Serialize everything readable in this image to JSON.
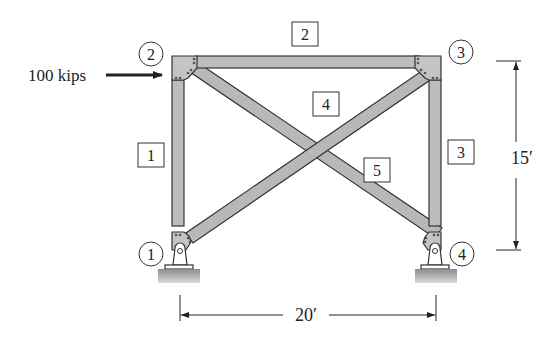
{
  "diagram": {
    "type": "truss-frame",
    "load": {
      "label": "100 kips",
      "direction": "right",
      "applied_at_node": "2"
    },
    "nodes": [
      {
        "id": "1",
        "label": "1",
        "support": "pin"
      },
      {
        "id": "2",
        "label": "2"
      },
      {
        "id": "3",
        "label": "3"
      },
      {
        "id": "4",
        "label": "4",
        "support": "pin"
      }
    ],
    "members": [
      {
        "id": "1",
        "label": "1",
        "from": "1",
        "to": "2"
      },
      {
        "id": "2",
        "label": "2",
        "from": "2",
        "to": "3"
      },
      {
        "id": "3",
        "label": "3",
        "from": "3",
        "to": "4"
      },
      {
        "id": "4",
        "label": "4",
        "from": "1",
        "to": "3"
      },
      {
        "id": "5",
        "label": "5",
        "from": "2",
        "to": "4"
      }
    ],
    "dimensions": {
      "height": "15′",
      "width": "20′"
    },
    "colors": {
      "member_fill": "#b8b8b8",
      "member_stroke": "#333333",
      "ground": "#9a9a9a",
      "text": "#222222"
    }
  }
}
